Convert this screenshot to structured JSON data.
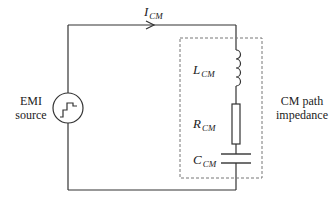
{
  "diagram": {
    "current_label": {
      "main": "I",
      "sub": "CM"
    },
    "source_label": {
      "line1": "EMI",
      "line2": "source"
    },
    "impedance_label": {
      "line1": "CM path",
      "line2": "impedance"
    },
    "components": [
      {
        "type": "inductor",
        "main": "L",
        "sub": "CM"
      },
      {
        "type": "resistor",
        "main": "R",
        "sub": "CM"
      },
      {
        "type": "capacitor",
        "main": "C",
        "sub": "CM"
      }
    ],
    "colors": {
      "wire": "#333333",
      "dashed_box": "#777777",
      "text": "#222222"
    }
  }
}
